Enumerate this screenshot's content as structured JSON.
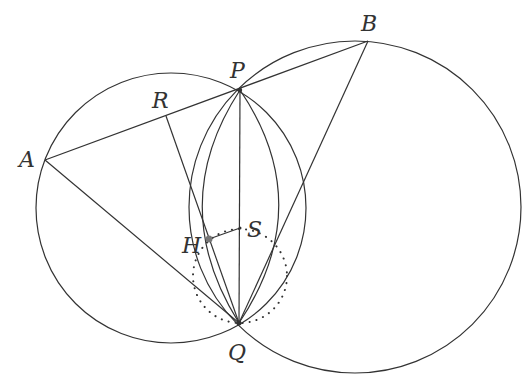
{
  "diagram": {
    "colors": {
      "stroke": "#333333",
      "background": "#ffffff",
      "point_H": "#777777"
    },
    "labels": {
      "A": "A",
      "B": "B",
      "P": "P",
      "Q": "Q",
      "R": "R",
      "H": "H",
      "S": "S"
    },
    "segments": [
      [
        "A",
        "B"
      ],
      [
        "A",
        "Q"
      ],
      [
        "B",
        "Q"
      ],
      [
        "P",
        "Q"
      ],
      [
        "R",
        "Q"
      ],
      [
        "H",
        "S"
      ]
    ],
    "circles": [
      {
        "name": "left-circle",
        "through": [
          "A",
          "P",
          "Q"
        ]
      },
      {
        "name": "right-circle",
        "through": [
          "B",
          "P",
          "Q"
        ]
      },
      {
        "name": "dotted-circle",
        "style": "dotted",
        "through": [
          "Q",
          "S"
        ]
      }
    ],
    "arcs": [
      {
        "name": "arc-through-H",
        "from": "P",
        "to": "Q",
        "via": "H"
      },
      {
        "name": "arc-right",
        "from": "P",
        "to": "Q"
      }
    ]
  }
}
